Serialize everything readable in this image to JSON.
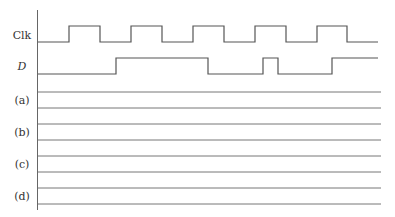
{
  "diagram": {
    "type": "timing-diagram",
    "axis": {
      "x": 37.5,
      "y_top": 10,
      "y_bottom": 210
    },
    "signals": [
      {
        "id": "clk",
        "label": "Clk",
        "italic": false,
        "label_y": 39,
        "low_y": 42,
        "high_y": 26,
        "start_level": "low",
        "x_start": 38,
        "x_end": 378,
        "transitions": [
          69,
          100,
          131,
          162,
          193,
          224,
          255,
          286,
          317,
          347
        ]
      },
      {
        "id": "d",
        "label": "D",
        "italic": true,
        "label_y": 70,
        "low_y": 74,
        "high_y": 58,
        "start_level": "low",
        "x_start": 38,
        "x_end": 378,
        "transitions": [
          116,
          208,
          263,
          278,
          332
        ]
      }
    ],
    "answer_rows": [
      {
        "id": "a",
        "label": "(a)",
        "label_y": 104,
        "top_y": 92,
        "bottom_y": 108
      },
      {
        "id": "b",
        "label": "(b)",
        "label_y": 136,
        "top_y": 124,
        "bottom_y": 140
      },
      {
        "id": "c",
        "label": "(c)",
        "label_y": 168,
        "top_y": 156,
        "bottom_y": 172
      },
      {
        "id": "d",
        "label": "(d)",
        "label_y": 200,
        "top_y": 188,
        "bottom_y": 204
      }
    ],
    "guide_x_start": 38,
    "guide_x_end": 381,
    "label_x": 22
  }
}
